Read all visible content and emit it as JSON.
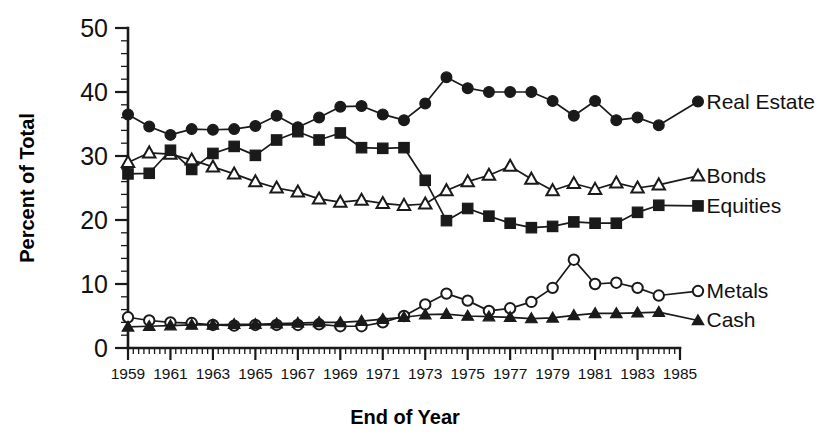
{
  "chart_data": {
    "type": "line",
    "title": "",
    "xlabel": "End of Year",
    "ylabel": "Percent of Total",
    "xlim": [
      1959,
      1985
    ],
    "ylim": [
      0,
      50
    ],
    "grid": false,
    "legend_position": "right-inline",
    "x": [
      1959,
      1960,
      1961,
      1962,
      1963,
      1964,
      1965,
      1966,
      1967,
      1968,
      1969,
      1970,
      1971,
      1972,
      1973,
      1974,
      1975,
      1976,
      1977,
      1978,
      1979,
      1980,
      1981,
      1982,
      1983,
      1984
    ],
    "xtick_labels": [
      "1959",
      "1961",
      "1963",
      "1965",
      "1967",
      "1969",
      "1971",
      "1973",
      "1975",
      "1977",
      "1979",
      "1981",
      "1983",
      "1985"
    ],
    "xtick_values": [
      1959,
      1961,
      1963,
      1965,
      1967,
      1969,
      1971,
      1973,
      1975,
      1977,
      1979,
      1981,
      1983,
      1985
    ],
    "ytick_labels": [
      "0",
      "10",
      "20",
      "30",
      "40",
      "50"
    ],
    "ytick_values": [
      0,
      10,
      20,
      30,
      40,
      50
    ],
    "series": [
      {
        "name": "Real Estate",
        "marker": "filled-circle",
        "values": [
          36.5,
          34.6,
          33.3,
          34.2,
          34.1,
          34.2,
          34.7,
          36.3,
          34.5,
          36.0,
          37.7,
          37.8,
          36.5,
          35.6,
          38.2,
          42.3,
          40.6,
          40.0,
          40.0,
          40.0,
          38.6,
          36.3,
          38.6,
          35.6,
          36.0,
          34.8
        ]
      },
      {
        "name": "Bonds",
        "marker": "open-triangle",
        "values": [
          29.0,
          30.5,
          30.3,
          29.4,
          28.3,
          27.2,
          26.0,
          25.0,
          24.4,
          23.3,
          22.8,
          23.1,
          22.6,
          22.3,
          22.5,
          24.6,
          26.0,
          27.0,
          28.4,
          26.4,
          24.6,
          25.7,
          24.8,
          25.8,
          25.0,
          25.5
        ]
      },
      {
        "name": "Equities",
        "marker": "filled-square",
        "values": [
          27.2,
          27.3,
          30.9,
          27.9,
          30.4,
          31.5,
          30.1,
          32.5,
          33.8,
          32.5,
          33.6,
          31.3,
          31.2,
          31.3,
          26.2,
          19.9,
          21.8,
          20.6,
          19.5,
          18.8,
          19.0,
          19.7,
          19.5,
          19.5,
          21.2,
          22.3
        ]
      },
      {
        "name": "Metals",
        "marker": "open-circle",
        "values": [
          4.8,
          4.3,
          4.0,
          3.9,
          3.6,
          3.5,
          3.6,
          3.6,
          3.6,
          3.7,
          3.4,
          3.4,
          4.0,
          5.0,
          6.8,
          8.5,
          7.4,
          5.8,
          6.2,
          7.2,
          9.4,
          13.8,
          10.0,
          10.2,
          9.4,
          8.2
        ]
      },
      {
        "name": "Cash",
        "marker": "filled-triangle",
        "values": [
          3.3,
          3.4,
          3.5,
          3.6,
          3.6,
          3.7,
          3.7,
          3.8,
          3.9,
          4.0,
          4.0,
          4.2,
          4.5,
          4.8,
          5.2,
          5.3,
          5.0,
          4.9,
          4.8,
          4.6,
          4.7,
          5.1,
          5.4,
          5.4,
          5.5,
          5.6
        ]
      }
    ],
    "annotations": [
      {
        "text": "Real Estate",
        "x": 1985.4,
        "y": 38.5
      },
      {
        "text": "Bonds",
        "x": 1985.4,
        "y": 26.9
      },
      {
        "text": "Equities",
        "x": 1985.4,
        "y": 22.2
      },
      {
        "text": "Metals",
        "x": 1985.4,
        "y": 8.9
      },
      {
        "text": "Cash",
        "x": 1985.4,
        "y": 4.3
      }
    ],
    "colors": {
      "ink": "#1a1a1a",
      "background": "#ffffff"
    }
  }
}
